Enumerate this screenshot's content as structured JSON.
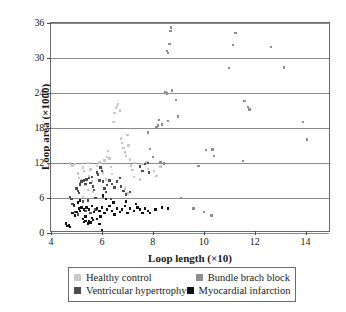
{
  "chart_data": {
    "type": "scatter",
    "title": "",
    "xlabel": "Loop length (×10)",
    "ylabel": "Loop area (×1000)",
    "xlim": [
      4,
      15
    ],
    "ylim": [
      0,
      36
    ],
    "xticks": [
      4,
      6,
      8,
      10,
      12,
      14
    ],
    "yticks": [
      0,
      6,
      12,
      18,
      24,
      30,
      36
    ],
    "grid": "horizontal",
    "legend_position": "below-axes",
    "series": [
      {
        "name": "Healthy control",
        "color": "#c9c9c9",
        "points": [
          [
            4.75,
            11.9
          ],
          [
            4.85,
            11.6
          ],
          [
            4.95,
            11.8
          ],
          [
            5.05,
            10.2
          ],
          [
            5.1,
            9.4
          ],
          [
            5.15,
            8.6
          ],
          [
            5.2,
            9.0
          ],
          [
            5.25,
            11.2
          ],
          [
            5.3,
            10.6
          ],
          [
            5.35,
            8.2
          ],
          [
            5.45,
            7.4
          ],
          [
            5.5,
            9.8
          ],
          [
            5.55,
            10.9
          ],
          [
            5.6,
            8.8
          ],
          [
            5.65,
            7.0
          ],
          [
            5.8,
            11.5
          ],
          [
            5.9,
            12.1
          ],
          [
            6.0,
            11.0
          ],
          [
            6.05,
            10.4
          ],
          [
            6.1,
            12.4
          ],
          [
            6.2,
            13.0
          ],
          [
            6.25,
            14.1
          ],
          [
            6.3,
            12.8
          ],
          [
            6.35,
            11.3
          ],
          [
            6.4,
            10.1
          ],
          [
            6.45,
            19.0
          ],
          [
            6.5,
            20.6
          ],
          [
            6.55,
            21.4
          ],
          [
            6.6,
            21.8
          ],
          [
            6.62,
            22.1
          ],
          [
            6.7,
            21.0
          ],
          [
            6.75,
            16.2
          ],
          [
            6.8,
            15.4
          ],
          [
            6.85,
            14.6
          ],
          [
            6.9,
            13.8
          ],
          [
            6.95,
            13.2
          ],
          [
            7.0,
            16.8
          ],
          [
            7.05,
            15.0
          ],
          [
            7.1,
            12.6
          ],
          [
            7.15,
            11.6
          ],
          [
            7.2,
            10.8
          ],
          [
            7.25,
            9.6
          ],
          [
            7.3,
            12.0
          ],
          [
            7.5,
            9.2
          ],
          [
            7.6,
            11.8
          ],
          [
            7.75,
            12.2
          ],
          [
            7.8,
            11.0
          ],
          [
            8.05,
            10.6
          ],
          [
            8.15,
            9.8
          ],
          [
            8.3,
            11.4
          ],
          [
            5.45,
            12.0
          ],
          [
            6.15,
            9.2
          ],
          [
            6.9,
            7.6
          ],
          [
            7.0,
            6.8
          ],
          [
            5.25,
            6.2
          ]
        ]
      },
      {
        "name": "Bundle brach block",
        "color": "#8f8f8f",
        "points": [
          [
            8.6,
            30.9
          ],
          [
            8.7,
            34.6
          ],
          [
            8.72,
            35.2
          ],
          [
            8.65,
            32.4
          ],
          [
            8.55,
            31.2
          ],
          [
            8.5,
            24.1
          ],
          [
            8.55,
            23.9
          ],
          [
            8.75,
            24.4
          ],
          [
            8.9,
            22.8
          ],
          [
            8.6,
            19.2
          ],
          [
            8.35,
            18.6
          ],
          [
            8.25,
            19.4
          ],
          [
            8.2,
            18.4
          ],
          [
            8.15,
            18.2
          ],
          [
            9.0,
            20.0
          ],
          [
            7.8,
            17.2
          ],
          [
            7.9,
            14.4
          ],
          [
            8.0,
            13.0
          ],
          [
            8.3,
            12.2
          ],
          [
            8.45,
            11.9
          ],
          [
            9.8,
            11.5
          ],
          [
            10.1,
            14.2
          ],
          [
            10.35,
            14.3
          ],
          [
            10.4,
            13.2
          ],
          [
            11.0,
            28.3
          ],
          [
            11.15,
            32.2
          ],
          [
            11.25,
            34.3
          ],
          [
            11.6,
            22.6
          ],
          [
            11.75,
            21.6
          ],
          [
            11.8,
            21.2
          ],
          [
            11.55,
            12.3
          ],
          [
            12.65,
            31.9
          ],
          [
            13.15,
            28.4
          ],
          [
            13.9,
            19.0
          ],
          [
            14.05,
            16.0
          ],
          [
            9.1,
            6.0
          ],
          [
            10.0,
            3.6
          ],
          [
            10.3,
            3.0
          ],
          [
            9.6,
            4.2
          ]
        ]
      },
      {
        "name": "Ventricular hypertrophy",
        "color": "#4d4d4d",
        "points": [
          [
            4.75,
            6.2
          ],
          [
            4.8,
            5.8
          ],
          [
            4.85,
            5.0
          ],
          [
            4.9,
            4.6
          ],
          [
            5.0,
            7.6
          ],
          [
            5.05,
            7.2
          ],
          [
            5.1,
            6.9
          ],
          [
            5.15,
            8.3
          ],
          [
            5.2,
            8.8
          ],
          [
            5.3,
            9.0
          ],
          [
            5.35,
            8.4
          ],
          [
            5.4,
            9.2
          ],
          [
            5.5,
            9.4
          ],
          [
            5.55,
            8.6
          ],
          [
            5.6,
            9.6
          ],
          [
            5.65,
            8.0
          ],
          [
            5.7,
            7.4
          ],
          [
            5.8,
            10.4
          ],
          [
            5.85,
            10.0
          ],
          [
            5.9,
            9.0
          ],
          [
            5.95,
            11.2
          ],
          [
            6.0,
            10.6
          ],
          [
            6.05,
            8.8
          ],
          [
            6.1,
            7.6
          ],
          [
            6.15,
            7.0
          ],
          [
            6.2,
            8.2
          ],
          [
            6.3,
            9.0
          ],
          [
            6.4,
            8.4
          ],
          [
            6.5,
            7.8
          ],
          [
            6.6,
            8.8
          ],
          [
            6.7,
            9.4
          ],
          [
            6.75,
            8.0
          ],
          [
            6.85,
            7.2
          ],
          [
            6.95,
            6.6
          ],
          [
            7.1,
            7.0
          ],
          [
            7.5,
            11.4
          ],
          [
            7.6,
            10.6
          ],
          [
            7.7,
            11.8
          ],
          [
            7.8,
            12.0
          ],
          [
            7.85,
            10.4
          ],
          [
            5.25,
            5.4
          ],
          [
            5.45,
            5.6
          ],
          [
            5.75,
            6.0
          ],
          [
            6.05,
            6.2
          ],
          [
            6.35,
            5.8
          ],
          [
            4.95,
            3.6
          ],
          [
            5.05,
            3.2
          ],
          [
            5.35,
            3.8
          ],
          [
            5.55,
            3.4
          ],
          [
            5.75,
            4.0
          ]
        ]
      },
      {
        "name": "Myocardial infarction",
        "color": "#111111",
        "points": [
          [
            4.6,
            1.6
          ],
          [
            4.65,
            1.2
          ],
          [
            4.7,
            1.4
          ],
          [
            4.75,
            1.0
          ],
          [
            5.25,
            2.4
          ],
          [
            5.3,
            1.9
          ],
          [
            5.35,
            2.1
          ],
          [
            5.45,
            1.6
          ],
          [
            5.5,
            2.0
          ],
          [
            5.55,
            1.8
          ],
          [
            5.6,
            2.6
          ],
          [
            5.65,
            2.2
          ],
          [
            5.8,
            2.4
          ],
          [
            5.9,
            1.5
          ],
          [
            6.0,
            0.5
          ],
          [
            4.85,
            3.4
          ],
          [
            4.95,
            3.0
          ],
          [
            5.0,
            3.6
          ],
          [
            5.1,
            4.2
          ],
          [
            5.15,
            3.8
          ],
          [
            5.2,
            4.4
          ],
          [
            5.3,
            4.0
          ],
          [
            5.4,
            4.4
          ],
          [
            5.5,
            4.0
          ],
          [
            5.6,
            4.6
          ],
          [
            5.7,
            3.6
          ],
          [
            5.8,
            4.2
          ],
          [
            5.9,
            3.8
          ],
          [
            6.0,
            4.4
          ],
          [
            6.1,
            3.4
          ],
          [
            6.2,
            4.0
          ],
          [
            6.3,
            4.6
          ],
          [
            6.4,
            3.8
          ],
          [
            6.5,
            3.2
          ],
          [
            6.6,
            4.2
          ],
          [
            6.7,
            3.6
          ],
          [
            6.8,
            4.0
          ],
          [
            6.9,
            4.6
          ],
          [
            7.0,
            3.4
          ],
          [
            7.1,
            4.2
          ],
          [
            7.25,
            3.8
          ],
          [
            7.4,
            4.4
          ],
          [
            7.5,
            4.0
          ],
          [
            7.6,
            3.4
          ],
          [
            7.7,
            4.2
          ],
          [
            7.8,
            3.8
          ],
          [
            7.9,
            3.4
          ],
          [
            8.1,
            4.0
          ],
          [
            8.35,
            4.4
          ],
          [
            8.6,
            4.2
          ],
          [
            6.15,
            5.8
          ],
          [
            6.45,
            5.2
          ],
          [
            6.95,
            5.4
          ],
          [
            7.35,
            5.0
          ],
          [
            6.05,
            6.4
          ],
          [
            4.9,
            4.8
          ],
          [
            5.05,
            5.2
          ],
          [
            5.15,
            5.6
          ],
          [
            5.35,
            2.8
          ],
          [
            5.95,
            2.8
          ]
        ]
      }
    ]
  },
  "axes": {
    "y_title": "Loop area (×1000)",
    "x_title": "Loop length (×10)",
    "y_tick_labels": [
      "36",
      "30",
      "24",
      "18",
      "12",
      "6",
      "0"
    ],
    "x_tick_labels": [
      "4",
      "6",
      "8",
      "10",
      "12",
      "14"
    ]
  },
  "legend": {
    "entries": [
      {
        "label": "Healthy control",
        "color": "#c9c9c9"
      },
      {
        "label": "Bundle brach block",
        "color": "#8f8f8f"
      },
      {
        "label": "Ventricular hypertrophy",
        "color": "#4d4d4d"
      },
      {
        "label": "Myocardial infarction",
        "color": "#111111"
      }
    ]
  }
}
